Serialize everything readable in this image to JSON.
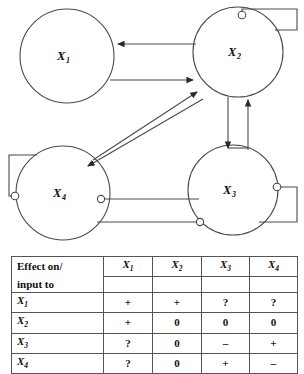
{
  "diagram": {
    "nodes": [
      {
        "id": "X1",
        "base": "X",
        "sub": "1",
        "cx": 67,
        "cy": 56,
        "r": 47
      },
      {
        "id": "X2",
        "base": "X",
        "sub": "2",
        "cx": 238,
        "cy": 52,
        "r": 45
      },
      {
        "id": "X3",
        "base": "X",
        "sub": "3",
        "cx": 233,
        "cy": 190,
        "r": 45
      },
      {
        "id": "X4",
        "base": "X",
        "sub": "4",
        "cx": 63,
        "cy": 193,
        "r": 47
      }
    ],
    "edges": [
      {
        "from": "X2",
        "to": "X1",
        "sign": "+",
        "terminal": "arrow",
        "shape": "straight-horizontal-upper"
      },
      {
        "from": "X1",
        "to": "X2",
        "sign": "+",
        "terminal": "arrow",
        "shape": "straight-horizontal-lower"
      },
      {
        "from": "X4",
        "to": "X2",
        "sign": "+",
        "terminal": "arrow",
        "shape": "diagonal-up-right"
      },
      {
        "from": "X2",
        "to": "X4",
        "sign": "+",
        "terminal": "arrow",
        "shape": "diagonal-down-left"
      },
      {
        "from": "X2",
        "to": "X3",
        "sign": "+",
        "terminal": "arrow",
        "shape": "vertical-down-left"
      },
      {
        "from": "X3",
        "to": "X2",
        "sign": "+",
        "terminal": "arrow",
        "shape": "vertical-up-right"
      },
      {
        "from": "X4",
        "to": "X3",
        "sign": "-",
        "terminal": "circle",
        "shape": "horizontal-upper"
      },
      {
        "from": "X3",
        "to": "X4",
        "sign": "-",
        "terminal": "circle",
        "shape": "horizontal-lower"
      },
      {
        "from": "X2",
        "to": "X2",
        "sign": "-",
        "terminal": "circle",
        "shape": "self-loop-top-right"
      },
      {
        "from": "X3",
        "to": "X3",
        "sign": "-",
        "terminal": "circle",
        "shape": "self-loop-right"
      },
      {
        "from": "X4",
        "to": "X4",
        "sign": "-",
        "terminal": "circle",
        "shape": "self-loop-left"
      }
    ],
    "colors": {
      "stroke": "#3a3a3a",
      "node_fill": "#ffffff",
      "background": "#ffffff"
    }
  },
  "table": {
    "corner_line1": "Effect on/",
    "corner_line2": "input to",
    "columns": [
      "X1",
      "X2",
      "X3",
      "X4"
    ],
    "column_bases": [
      "X",
      "X",
      "X",
      "X"
    ],
    "column_subs": [
      "1",
      "2",
      "3",
      "4"
    ],
    "rows": [
      {
        "label_base": "X",
        "label_sub": "1",
        "cells": [
          "+",
          "+",
          "?",
          "?"
        ]
      },
      {
        "label_base": "X",
        "label_sub": "2",
        "cells": [
          "+",
          "0",
          "0",
          "0"
        ]
      },
      {
        "label_base": "X",
        "label_sub": "3",
        "cells": [
          "?",
          "0",
          "–",
          "+"
        ]
      },
      {
        "label_base": "X",
        "label_sub": "4",
        "cells": [
          "?",
          "0",
          "+",
          "–"
        ]
      }
    ]
  }
}
